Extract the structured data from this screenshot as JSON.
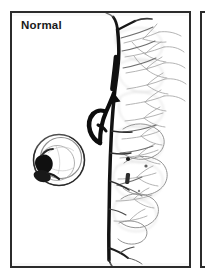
{
  "figure": {
    "type": "medical-angiogram-figure-panel",
    "modality": "Digital subtraction angiography (DSA)",
    "panels": [
      {
        "label": "Normal",
        "description": "Lateral cervical angiogram showing a normal, smoothly tapering vertical cervical artery with branching vessels along its posterior aspect; an arrow marks the proximal segment and a looped catheter is seen at lower left."
      }
    ],
    "annotations": {
      "arrow_label": "arrow-marker",
      "catheter_loop_label": "catheter-loop",
      "clip_markers_label": "radiopaque-markers"
    },
    "colors": {
      "border": "#2b2b2b",
      "background": "#ffffff",
      "vessel_dark": "#141414",
      "vessel_mid": "#4a4a4a",
      "vessel_faint": "#9a9a9a",
      "vessel_very_faint": "#c2c2c2",
      "label_text": "#1a1a1a"
    }
  },
  "next_panel": {
    "label": ""
  }
}
